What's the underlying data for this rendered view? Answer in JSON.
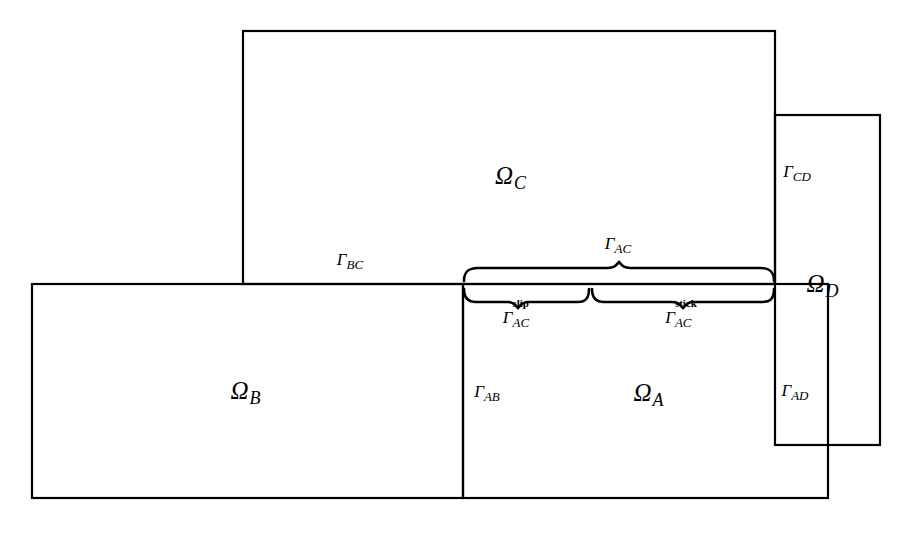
{
  "figure": {
    "kind": "domain-decomposition-diagram",
    "background_color": "#ffffff",
    "line_color": "#000000",
    "width": 905,
    "height": 533
  },
  "domains": [
    {
      "key": "omega_c",
      "label": "Ω",
      "subscript": "C",
      "name": "Omega_C",
      "rect": {
        "x": 243,
        "y": 31,
        "w": 532,
        "h": 253
      },
      "label_pos": {
        "x": 510,
        "y": 175
      }
    },
    {
      "key": "omega_b",
      "label": "Ω",
      "subscript": "B",
      "name": "Omega_B",
      "rect": {
        "x": 32,
        "y": 284,
        "w": 431,
        "h": 214
      },
      "label_pos": {
        "x": 245,
        "y": 390
      }
    },
    {
      "key": "omega_a",
      "label": "Ω",
      "subscript": "A",
      "name": "Omega_A",
      "rect": {
        "x": 463,
        "y": 284,
        "w": 365,
        "h": 214
      },
      "label_pos": {
        "x": 648,
        "y": 392
      }
    },
    {
      "key": "omega_d",
      "label": "Ω",
      "subscript": "D",
      "name": "Omega_D",
      "rect": {
        "x": 775,
        "y": 115,
        "w": 105,
        "h": 330
      },
      "label_pos": {
        "x": 822,
        "y": 283
      }
    }
  ],
  "interfaces": [
    {
      "key": "gamma_bc",
      "label": "Γ",
      "subscript": "BC",
      "name": "Gamma_BC",
      "label_pos": {
        "x": 350,
        "y": 259
      }
    },
    {
      "key": "gamma_ac",
      "label": "Γ",
      "subscript": "AC",
      "name": "Gamma_AC",
      "label_pos": {
        "x": 618,
        "y": 243
      }
    },
    {
      "key": "gamma_ac_slip",
      "label": "Γ",
      "subscript": "AC",
      "superscript": "slip",
      "name": "Gamma_AC_slip",
      "label_pos": {
        "x": 517,
        "y": 317
      }
    },
    {
      "key": "gamma_ac_stick",
      "label": "Γ",
      "subscript": "AC",
      "superscript": "stick",
      "name": "Gamma_AC_stick",
      "label_pos": {
        "x": 682,
        "y": 317
      }
    },
    {
      "key": "gamma_ab",
      "label": "Γ",
      "subscript": "AB",
      "name": "Gamma_AB",
      "label_pos": {
        "x": 487,
        "y": 391
      }
    },
    {
      "key": "gamma_cd",
      "label": "Γ",
      "subscript": "CD",
      "name": "Gamma_CD",
      "label_pos": {
        "x": 797,
        "y": 171
      }
    },
    {
      "key": "gamma_ad",
      "label": "Γ",
      "subscript": "AD",
      "name": "Gamma_AD",
      "label_pos": {
        "x": 795,
        "y": 390
      }
    }
  ],
  "braces": [
    {
      "key": "brace_ac",
      "name": "brace-gamma-ac",
      "x_start": 463,
      "x_end": 775,
      "y": 280,
      "direction": "up"
    },
    {
      "key": "brace_ac_slip",
      "name": "brace-gamma-ac-slip",
      "x_start": 463,
      "x_end": 590,
      "y": 289,
      "direction": "down"
    },
    {
      "key": "brace_ac_stick",
      "name": "brace-gamma-ac-stick",
      "x_start": 590,
      "x_end": 775,
      "y": 289,
      "direction": "down"
    }
  ]
}
